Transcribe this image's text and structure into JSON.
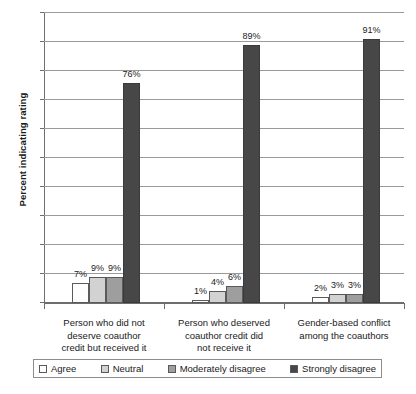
{
  "chart_data": {
    "type": "bar",
    "title": "",
    "xlabel": "",
    "ylabel": "Percent indicating rating",
    "ylim": [
      0,
      100
    ],
    "grid": true,
    "legend_position": "bottom",
    "value_suffix": "%",
    "categories": [
      "Person who did not deserve coauthor credit but received it",
      "Person who deserved coauthor credit did not receive it",
      "Gender-based conflict among the coauthors"
    ],
    "category_lines": [
      [
        "Person who did not",
        "deserve coauthor",
        "credit but received it"
      ],
      [
        "Person who deserved",
        "coauthor credit did",
        "not receive it"
      ],
      [
        "Gender-based conflict",
        "among the coauthors"
      ]
    ],
    "series": [
      {
        "name": "Agree",
        "color": "#fdfdfd",
        "values": [
          7,
          1,
          2
        ],
        "labels": [
          "7%",
          "1%",
          "2%"
        ]
      },
      {
        "name": "Neutral",
        "color": "#d2d2d2",
        "values": [
          9,
          4,
          3
        ],
        "labels": [
          "9%",
          "4%",
          "3%"
        ]
      },
      {
        "name": "Moderately disagree",
        "color": "#9e9e9e",
        "values": [
          9,
          6,
          3
        ],
        "labels": [
          "9%",
          "6%",
          "3%"
        ]
      },
      {
        "name": "Strongly disagree",
        "color": "#474747",
        "values": [
          76,
          89,
          91
        ],
        "labels": [
          "76%",
          "89%",
          "91%"
        ]
      }
    ],
    "y_ticks": [
      "0%",
      "10%",
      "20%",
      "30%",
      "40%",
      "50%",
      "60%",
      "70%",
      "80%",
      "90%",
      "100%"
    ]
  }
}
